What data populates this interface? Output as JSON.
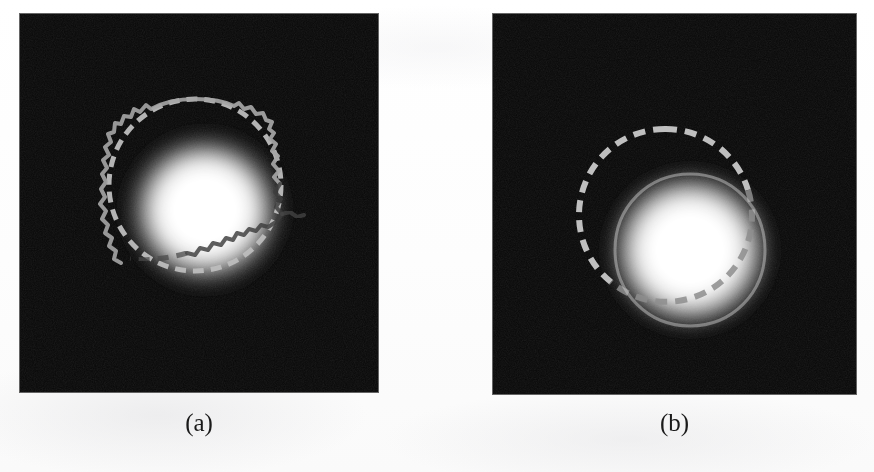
{
  "figure": {
    "background_color": "#fefefe",
    "panel_background_color": "#070707",
    "reference_contour_color": "#b9b9b9",
    "result_contour_color": "#a8a8a8",
    "blob_core_color": "#ffffff"
  },
  "panels": [
    {
      "id": "panel-a",
      "caption": "(a)",
      "x": 20,
      "y": 14,
      "width": 358,
      "height": 378,
      "blob": {
        "cx": 185,
        "cy": 196,
        "radius": 78,
        "core_radius": 44
      },
      "reference_circle": {
        "label": "dashed-reference-circle",
        "cx": 175,
        "cy": 171,
        "radius": 86,
        "dash": "11 7",
        "stroke_width": 5,
        "color": "#bdbdbd"
      },
      "result_contour": {
        "label": "jagged-segmentation-contour",
        "style": "irregular",
        "stroke_width": 4,
        "color": "#a6a6a6"
      }
    },
    {
      "id": "panel-b",
      "caption": "(b)",
      "x": 493,
      "y": 14,
      "width": 363,
      "height": 380,
      "blob": {
        "cx": 197,
        "cy": 236,
        "radius": 80,
        "core_radius": 46
      },
      "reference_circle": {
        "label": "dashed-reference-circle",
        "cx": 172,
        "cy": 201,
        "radius": 86,
        "dash": "12 8",
        "stroke_width": 6,
        "color": "#c4c4c4"
      },
      "result_contour": {
        "label": "smooth-segmentation-contour",
        "style": "smooth",
        "stroke_width": 3,
        "color": "#cfcfcf"
      }
    }
  ],
  "captions": {
    "panel_a_label": "(a)",
    "panel_b_label": "(b)",
    "panel_a_x": 20,
    "panel_a_width": 358,
    "panel_b_x": 493,
    "panel_b_width": 363,
    "caption_y": 410
  }
}
